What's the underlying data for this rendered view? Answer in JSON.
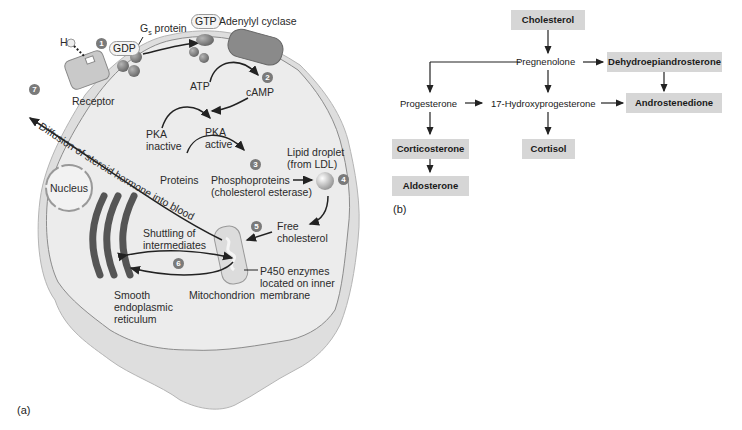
{
  "panel_a": {
    "tag": "(a)",
    "labels": {
      "hormone": "H",
      "gdp": "GDP",
      "gs_protein": "G",
      "gs_sub": "s",
      "gs_protein_rest": " protein",
      "gtp": "GTP",
      "adenylyl_cyclase": "Adenylyl cyclase",
      "receptor": "Receptor",
      "atp": "ATP",
      "camp": "cAMP",
      "pka_inactive_1": "PKA",
      "pka_inactive_2": "inactive",
      "pka_active_1": "PKA",
      "pka_active_2": "active",
      "proteins": "Proteins",
      "phosphoproteins_1": "Phosphoproteins",
      "phosphoproteins_2": "(cholesterol esterase)",
      "lipid_droplet_1": "Lipid droplet",
      "lipid_droplet_2": "(from LDL)",
      "free_chol_1": "Free",
      "free_chol_2": "cholesterol",
      "nucleus": "Nucleus",
      "shuttling_1": "Shuttling of",
      "shuttling_2": "intermediates",
      "p450_1": "P450 enzymes",
      "p450_2": "located on inner",
      "p450_3": "membrane",
      "mitochondrion": "Mitochondrion",
      "ser_1": "Smooth",
      "ser_2": "endoplasmic",
      "ser_3": "reticulum",
      "diffusion": "Diffusion of steroid hormone into blood",
      "alpha": "α",
      "beta": "β",
      "gamma": "γ"
    },
    "steps": [
      "1",
      "2",
      "3",
      "4",
      "5",
      "6",
      "7"
    ]
  },
  "panel_b": {
    "tag": "(b)",
    "nodes": {
      "cholesterol": "Cholesterol",
      "pregnenolone": "Pregnenolone",
      "dhea": "Dehydroepiandrosterone",
      "progesterone": "Progesterone",
      "hydroxyprogesterone": "17-Hydroxyprogesterone",
      "androstenedione": "Androstenedione",
      "corticosterone": "Corticosterone",
      "cortisol": "Cortisol",
      "aldosterone": "Aldosterone"
    },
    "colors": {
      "box_fill": "#d6d6d6",
      "arrow": "#222222"
    }
  }
}
